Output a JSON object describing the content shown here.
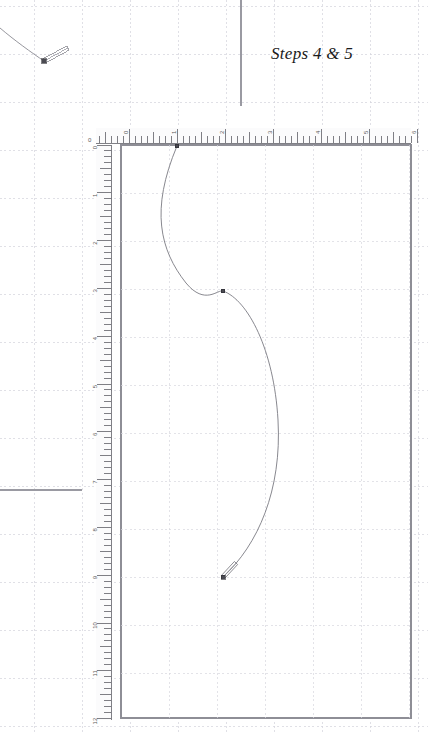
{
  "app": {
    "type": "cad-drafting-canvas",
    "background_color": "#ffffff"
  },
  "annotation": {
    "name": "steps-label",
    "text": "Steps 4 & 5",
    "color": "#1a1a1a",
    "x": 271,
    "y": 44
  },
  "grid": {
    "major_color": "#cfcfd8",
    "minor_dot_color": "#d9d9e0",
    "major_spacing_px": 48,
    "style": "dashed-dotted"
  },
  "canvas_panel": {
    "name": "drawing-canvas",
    "border_color": "#8e8e96",
    "x": 121,
    "y": 145,
    "width": 290,
    "height": 573,
    "fill": "#ffffff"
  },
  "upper_panel": {
    "name": "upper-left-panel",
    "divider_vertical_x": 241,
    "divider_vertical_y0": 0,
    "divider_vertical_y1": 106,
    "divider_horizontal_y": 490,
    "divider_horizontal_x0": 0,
    "divider_horizontal_x1": 82,
    "border_color": "#9a9aa2"
  },
  "ruler_horizontal": {
    "name": "horizontal-ruler",
    "x": 96,
    "y": 128,
    "width": 315,
    "height": 15,
    "origin_label": "0",
    "labels": [
      "0",
      "1",
      "2",
      "3",
      "4",
      "5",
      "6"
    ],
    "unit_px": 48,
    "minor_divisions": 8,
    "tick_color": "#4a4a52",
    "background": "#fbfbfc"
  },
  "ruler_vertical": {
    "name": "vertical-ruler",
    "x": 96,
    "y": 145,
    "width": 15,
    "height": 575,
    "labels": [
      "0",
      "1",
      "2",
      "3",
      "4",
      "5",
      "6",
      "7",
      "8",
      "9",
      "10",
      "11",
      "12"
    ],
    "unit_px": 47.8,
    "minor_divisions": 8,
    "tick_color": "#4a4a52",
    "background": "#fbfbfc"
  },
  "curve_main": {
    "name": "spline-curve",
    "stroke": "#7a7a82",
    "stroke_width": 0.9,
    "path": "M 177,146 C 150,210 160,250 186,283 C 205,306 218,289 223,291 C 248,300 274,350 278,420 C 282,490 258,545 223,577",
    "nodes": [
      {
        "name": "node-start",
        "x": 177,
        "y": 146,
        "kind": "control-point"
      },
      {
        "name": "node-mid",
        "x": 223,
        "y": 291,
        "kind": "control-point"
      },
      {
        "name": "node-end",
        "x": 223,
        "y": 577,
        "kind": "endpoint-with-handle"
      }
    ],
    "end_handle": {
      "x1": 223,
      "y1": 577,
      "x2": 236,
      "y2": 563
    }
  },
  "curve_fragment": {
    "name": "spline-fragment",
    "stroke": "#8a8a92",
    "stroke_width": 0.9,
    "path": "M 0,28 C 14,40 32,53 44,61",
    "node": {
      "name": "fragment-node",
      "x": 44,
      "y": 61
    },
    "handle": {
      "x1": 44,
      "y1": 61,
      "x2": 68,
      "y2": 48
    }
  }
}
